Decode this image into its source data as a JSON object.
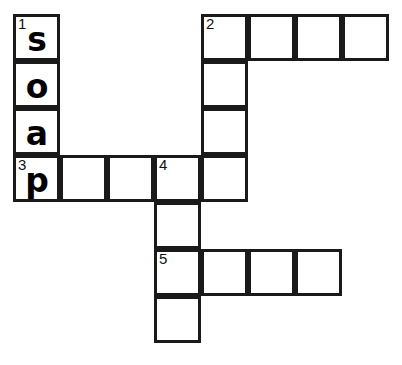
{
  "puzzle": {
    "title": "Crossword Grid",
    "grid": {
      "origin_x": 13,
      "origin_y": 14,
      "cell_size": 47,
      "border_color": "#1a1a1a",
      "cell_background": "#ffffff",
      "page_background": "#ffffff",
      "columns": 8,
      "rows": 7
    },
    "cells": [
      {
        "name": "cell-r0c0",
        "col": 0,
        "row": 0,
        "number": "1",
        "letter": "s"
      },
      {
        "name": "cell-r1c0",
        "col": 0,
        "row": 1,
        "number": "",
        "letter": "o"
      },
      {
        "name": "cell-r2c0",
        "col": 0,
        "row": 2,
        "number": "",
        "letter": "a"
      },
      {
        "name": "cell-r3c0",
        "col": 0,
        "row": 3,
        "number": "3",
        "letter": "p"
      },
      {
        "name": "cell-r3c1",
        "col": 1,
        "row": 3,
        "number": "",
        "letter": ""
      },
      {
        "name": "cell-r3c2",
        "col": 2,
        "row": 3,
        "number": "",
        "letter": ""
      },
      {
        "name": "cell-r3c3",
        "col": 3,
        "row": 3,
        "number": "4",
        "letter": ""
      },
      {
        "name": "cell-r4c3",
        "col": 3,
        "row": 4,
        "number": "",
        "letter": ""
      },
      {
        "name": "cell-r5c3",
        "col": 3,
        "row": 5,
        "number": "5",
        "letter": ""
      },
      {
        "name": "cell-r6c3",
        "col": 3,
        "row": 6,
        "number": "",
        "letter": ""
      },
      {
        "name": "cell-r0c4",
        "col": 4,
        "row": 0,
        "number": "2",
        "letter": ""
      },
      {
        "name": "cell-r1c4",
        "col": 4,
        "row": 1,
        "number": "",
        "letter": ""
      },
      {
        "name": "cell-r2c4",
        "col": 4,
        "row": 2,
        "number": "",
        "letter": ""
      },
      {
        "name": "cell-r3c4",
        "col": 4,
        "row": 3,
        "number": "",
        "letter": ""
      },
      {
        "name": "cell-r0c5",
        "col": 5,
        "row": 0,
        "number": "",
        "letter": ""
      },
      {
        "name": "cell-r0c6",
        "col": 6,
        "row": 0,
        "number": "",
        "letter": ""
      },
      {
        "name": "cell-r0c7",
        "col": 7,
        "row": 0,
        "number": "",
        "letter": ""
      },
      {
        "name": "cell-r5c4",
        "col": 4,
        "row": 5,
        "number": "",
        "letter": ""
      },
      {
        "name": "cell-r5c5",
        "col": 5,
        "row": 5,
        "number": "",
        "letter": ""
      },
      {
        "name": "cell-r5c6",
        "col": 6,
        "row": 5,
        "number": "",
        "letter": ""
      }
    ],
    "entries": {
      "across": [
        {
          "number": "3",
          "start_col": 0,
          "start_row": 3,
          "length": 5,
          "filled": "p"
        },
        {
          "number": "2",
          "start_col": 4,
          "start_row": 0,
          "length": 4,
          "filled": ""
        },
        {
          "number": "5",
          "start_col": 3,
          "start_row": 5,
          "length": 4,
          "filled": ""
        }
      ],
      "down": [
        {
          "number": "1",
          "start_col": 0,
          "start_row": 0,
          "length": 4,
          "filled": "soap"
        },
        {
          "number": "2",
          "start_col": 4,
          "start_row": 0,
          "length": 4,
          "filled": ""
        },
        {
          "number": "4",
          "start_col": 3,
          "start_row": 3,
          "length": 4,
          "filled": ""
        }
      ]
    }
  }
}
